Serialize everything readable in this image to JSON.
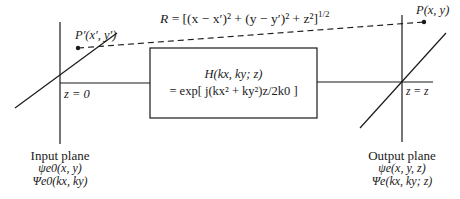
{
  "diagram": {
    "distance_formula": "R = [(x − x′)² + (y − y′)² + z²]^1/2",
    "distance_formula_parts": {
      "lhs": "R",
      "rhs": " = [(x − x′)² + (y − y′)² + z²]",
      "exponent": "1/2"
    },
    "source_point": "P′(x′, y′)",
    "observation_point": "P(x, y)",
    "input_plane": {
      "z_label": "z = 0",
      "title": "Input plane",
      "field": "ψe0(x, y)",
      "spectrum": "Ψe0(kx, ky)"
    },
    "output_plane": {
      "z_label": "z = z",
      "title": "Output plane",
      "field": "ψe(x, y, z)",
      "spectrum": "Ψe(kx, ky; z)"
    },
    "transfer_function": {
      "line1": "H(kx, ky; z)",
      "line2": "= exp[ j(kx² + ky²)z/2k0 ]"
    },
    "colors": {
      "ink": "#1a1a1a",
      "background": "#ffffff"
    }
  }
}
